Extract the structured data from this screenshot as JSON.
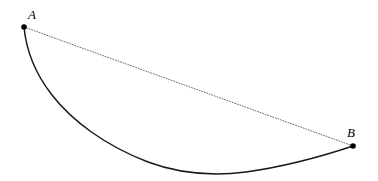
{
  "figure": {
    "kind": "geometry-diagram",
    "background_color": "#ffffff",
    "width": 378,
    "height": 181,
    "points": [
      {
        "id": "A",
        "label": "A",
        "x": 24,
        "y": 27,
        "marker": "filled-circle",
        "radius": 2.8,
        "color": "#000000",
        "label_x": 32,
        "label_y": 15
      },
      {
        "id": "B",
        "label": "B",
        "x": 353,
        "y": 146,
        "marker": "filled-circle",
        "radius": 2.8,
        "color": "#000000",
        "label_x": 352,
        "label_y": 133
      }
    ],
    "chord": {
      "name": "straight-line-A-to-B",
      "style": "dotted",
      "color": "#555555",
      "stroke_width": 0.9,
      "dash_pattern": "0.9 1.8",
      "path": "M 24 27 L 353 146"
    },
    "curve": {
      "name": "brachistochrone-curve-A-to-B",
      "style": "solid",
      "color": "#1a1a1a",
      "stroke_width": 1.5,
      "path": "M 24 27 C 26 48, 34 72, 52 95 C 72 121, 106 146, 148 162 C 180 174, 214 176, 246 172 C 282 167, 320 157, 353 146",
      "lowest_point_x": 222,
      "lowest_point_y": 173
    }
  }
}
